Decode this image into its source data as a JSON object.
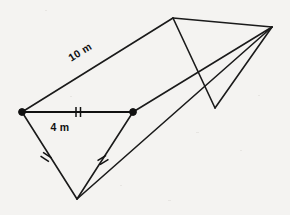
{
  "figure": {
    "name": "triangular-prism",
    "background_color": "#f4f3f1",
    "ink_color": "#1a1a1a"
  },
  "labels": {
    "length_label": "10 m",
    "base_label": "4 m"
  },
  "vertices": {
    "front_left": {
      "x": 22,
      "y": 112
    },
    "front_right": {
      "x": 133,
      "y": 112
    },
    "front_bottom": {
      "x": 77,
      "y": 199
    },
    "back_top": {
      "x": 173,
      "y": 18
    },
    "back_right": {
      "x": 272,
      "y": 27
    },
    "back_bottom": {
      "x": 215,
      "y": 108
    }
  },
  "label_positions": {
    "length_label": {
      "x": 82,
      "y": 55,
      "rotation": -32
    },
    "base_label": {
      "x": 60,
      "y": 131
    }
  },
  "tick_marks": [
    {
      "name": "base-tick",
      "x": 78,
      "y": 112,
      "angle": 0,
      "count": 2
    },
    {
      "name": "left-side-tick",
      "x": 46,
      "y": 157,
      "angle": -57,
      "count": 2
    },
    {
      "name": "right-side-tick",
      "x": 103,
      "y": 160,
      "angle": 58,
      "count": 2
    }
  ],
  "edges": [
    {
      "name": "front-base-edge",
      "from": "front_left",
      "to": "front_right",
      "measured": "4 m"
    },
    {
      "name": "front-left-edge",
      "from": "front_left",
      "to": "front_bottom"
    },
    {
      "name": "front-right-edge",
      "from": "front_right",
      "to": "front_bottom"
    },
    {
      "name": "lateral-top-edge",
      "from": "front_left",
      "to": "back_top",
      "measured": "10 m"
    },
    {
      "name": "lateral-right-edge",
      "from": "front_right",
      "to": "back_right"
    },
    {
      "name": "lateral-bottom-edge",
      "from": "front_bottom",
      "to": "back_right"
    },
    {
      "name": "back-top-edge",
      "from": "back_top",
      "to": "back_right"
    },
    {
      "name": "back-left-edge",
      "from": "back_top",
      "to": "back_bottom"
    },
    {
      "name": "back-right-edge",
      "from": "back_bottom",
      "to": "back_right"
    }
  ]
}
